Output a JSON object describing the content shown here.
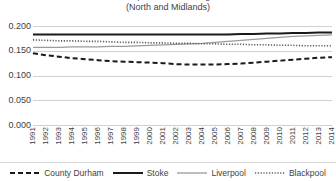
{
  "chart_data": {
    "type": "line",
    "title": "Relative Deprivation: Ratio Ages 16-24",
    "subtitle": "(North and Midlands)",
    "title_lines": [
      "Relative Deprivation: Ratio Ages 16-24",
      "(North and Midlands)"
    ],
    "xlabel": "",
    "ylabel": "",
    "ylim": [
      0.0,
      0.2
    ],
    "yticks": [
      0.0,
      0.05,
      0.1,
      0.15,
      0.2
    ],
    "ytick_labels": [
      "0.000",
      "0.050",
      "0.100",
      "0.150",
      "0.200"
    ],
    "grid": true,
    "legend_position": "bottom",
    "x": [
      1991,
      1992,
      1993,
      1994,
      1995,
      1996,
      1997,
      1998,
      1999,
      2000,
      2001,
      2002,
      2003,
      2004,
      2005,
      2006,
      2007,
      2008,
      2009,
      2010,
      2011,
      2012,
      2013,
      2014
    ],
    "categories": [
      "1991",
      "1992",
      "1993",
      "1994",
      "1995",
      "1996",
      "1997",
      "1998",
      "1999",
      "2000",
      "2001",
      "2002",
      "2003",
      "2004",
      "2005",
      "2006",
      "2007",
      "2008",
      "2009",
      "2010",
      "2011",
      "2012",
      "2013",
      "2014"
    ],
    "series": [
      {
        "name": "County Durham",
        "style": "dashed",
        "color": "#1a1a1a",
        "values": [
          0.145,
          0.141,
          0.138,
          0.135,
          0.133,
          0.131,
          0.129,
          0.128,
          0.127,
          0.126,
          0.125,
          0.123,
          0.122,
          0.122,
          0.122,
          0.123,
          0.124,
          0.126,
          0.128,
          0.13,
          0.132,
          0.134,
          0.136,
          0.137
        ]
      },
      {
        "name": "Stoke",
        "style": "solid",
        "color": "#1a1a1a",
        "values": [
          0.183,
          0.183,
          0.183,
          0.183,
          0.183,
          0.183,
          0.183,
          0.183,
          0.183,
          0.183,
          0.183,
          0.183,
          0.183,
          0.183,
          0.183,
          0.183,
          0.184,
          0.184,
          0.185,
          0.185,
          0.186,
          0.186,
          0.187,
          0.187
        ]
      },
      {
        "name": "Liverpool",
        "style": "solid-gray",
        "color": "#9b9b9b",
        "values": [
          0.157,
          0.157,
          0.157,
          0.158,
          0.158,
          0.158,
          0.159,
          0.159,
          0.16,
          0.161,
          0.162,
          0.163,
          0.164,
          0.165,
          0.167,
          0.169,
          0.171,
          0.173,
          0.175,
          0.177,
          0.179,
          0.18,
          0.181,
          0.182
        ]
      },
      {
        "name": "Blackpool",
        "style": "dotted",
        "color": "#5a5a5a",
        "values": [
          0.172,
          0.171,
          0.17,
          0.17,
          0.169,
          0.169,
          0.168,
          0.167,
          0.167,
          0.166,
          0.166,
          0.165,
          0.165,
          0.164,
          0.164,
          0.163,
          0.163,
          0.162,
          0.162,
          0.161,
          0.161,
          0.16,
          0.16,
          0.16
        ]
      }
    ]
  },
  "legend": {
    "items": [
      {
        "label": "County Durham"
      },
      {
        "label": "Stoke"
      },
      {
        "label": "Liverpool"
      },
      {
        "label": "Blackpool"
      }
    ]
  }
}
